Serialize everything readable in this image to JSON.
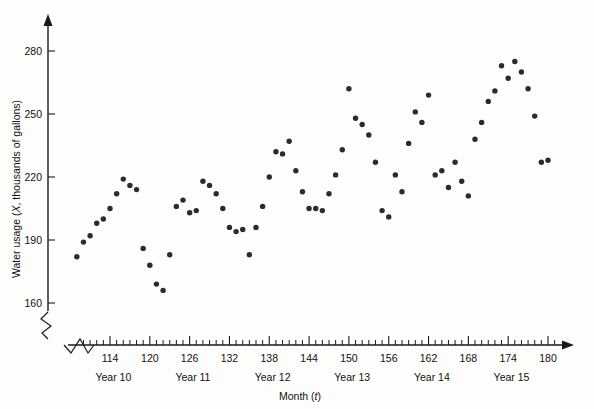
{
  "chart_data": {
    "type": "scatter",
    "title": "",
    "xlabel": "Month (t)",
    "ylabel": "Water usage (X, thousands of gallons)",
    "xlim": [
      108.5,
      181.5
    ],
    "ylim": [
      160,
      290
    ],
    "grid": false,
    "legend": null,
    "y_ticks": [
      160,
      190,
      220,
      250,
      280
    ],
    "x_ticks": [
      114,
      120,
      126,
      132,
      138,
      144,
      150,
      156,
      162,
      168,
      174,
      180
    ],
    "x_minor_tick_step": 1,
    "axis_break": true,
    "point_color": "#2b2b2b",
    "axis_color": "#1a1a1a",
    "group_labels": [
      {
        "label": "Year 10",
        "center_x": 114.5
      },
      {
        "label": "Year 11",
        "center_x": 126.5
      },
      {
        "label": "Year 12",
        "center_x": 138.5
      },
      {
        "label": "Year 13",
        "center_x": 150.5
      },
      {
        "label": "Year 14",
        "center_x": 162.5
      },
      {
        "label": "Year 15",
        "center_x": 174.5
      }
    ],
    "x": [
      109,
      110,
      111,
      112,
      113,
      114,
      115,
      116,
      117,
      118,
      119,
      120,
      121,
      122,
      123,
      124,
      125,
      126,
      127,
      128,
      129,
      130,
      131,
      132,
      133,
      134,
      135,
      136,
      137,
      138,
      139,
      140,
      141,
      142,
      143,
      144,
      145,
      146,
      147,
      148,
      149,
      150,
      151,
      152,
      153,
      154,
      155,
      156,
      157,
      158,
      159,
      160,
      161,
      162,
      163,
      164,
      165,
      166,
      167,
      168,
      169,
      170,
      171,
      172,
      173,
      174,
      175,
      176,
      177,
      178,
      179,
      180
    ],
    "y": [
      182,
      189,
      192,
      198,
      200,
      205,
      212,
      219,
      216,
      214,
      186,
      178,
      169,
      166,
      183,
      206,
      209,
      203,
      204,
      218,
      216,
      212,
      205,
      196,
      194,
      195,
      183,
      196,
      206,
      220,
      232,
      231,
      237,
      223,
      213,
      205,
      205,
      204,
      212,
      221,
      233,
      262,
      248,
      245,
      240,
      227,
      204,
      201,
      221,
      213,
      236,
      251,
      246,
      259,
      221,
      223,
      215,
      227,
      218,
      211,
      238,
      246,
      256,
      261,
      273,
      267,
      275,
      270,
      262,
      249,
      227,
      228
    ]
  }
}
